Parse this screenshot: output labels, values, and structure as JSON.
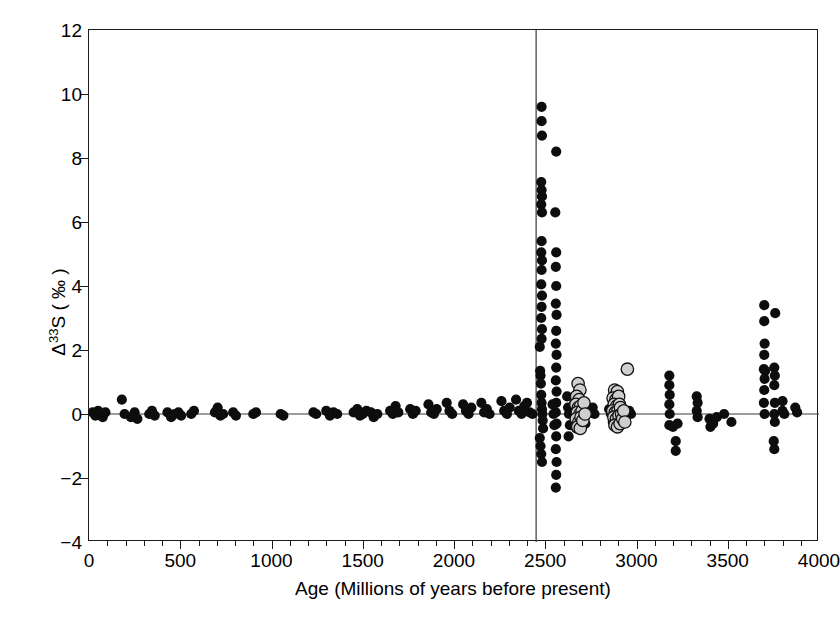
{
  "figure": {
    "x_axis": {
      "title": "Age (Millions of years before present)",
      "min": 0,
      "max": 4000,
      "major_ticks": [
        0,
        500,
        1000,
        1500,
        2000,
        2500,
        3000,
        3500,
        4000
      ],
      "tick_labels": [
        "0",
        "500",
        "1000",
        "1500",
        "2000",
        "2500",
        "3000",
        "3500",
        "4000"
      ],
      "minor_tick_step": 100
    },
    "y_axis": {
      "title_prefix": "Δ",
      "title_sup": "33",
      "title_suffix": "S ( ‰ )",
      "title_plain": "Δ33S ( ‰ )",
      "min": -4,
      "max": 12,
      "major_ticks": [
        -4,
        -2,
        0,
        2,
        4,
        6,
        8,
        10,
        12
      ],
      "tick_labels": [
        "−4",
        "−2",
        "0",
        "2",
        "4",
        "6",
        "8",
        "10",
        "12"
      ]
    },
    "reference_lines": {
      "vertical_age": 2450,
      "horizontal_value": 0,
      "color": "#3a3a3a"
    },
    "colors": {
      "black_marker": "#0d0d0d",
      "gray_marker_fill": "#cfcfcf",
      "gray_marker_stroke": "#111111",
      "axis": "#1a1a1a",
      "background": "#ffffff"
    }
  },
  "chart_data": {
    "type": "scatter",
    "title": "",
    "xlabel": "Age (Millions of years before present)",
    "ylabel": "Δ33S ( ‰ )",
    "xlim": [
      0,
      4000
    ],
    "ylim": [
      -4,
      12
    ],
    "grid": false,
    "legend": "none",
    "annotations": [
      {
        "type": "vline",
        "x": 2450,
        "note": "Great Oxidation Event boundary"
      },
      {
        "type": "hline",
        "y": 0,
        "note": "zero mass-independent fractionation"
      }
    ],
    "series": [
      {
        "name": "black-circles",
        "marker": "filled-circle-black",
        "points": [
          [
            20,
            0.05
          ],
          [
            35,
            -0.05
          ],
          [
            50,
            0.1
          ],
          [
            60,
            0.0
          ],
          [
            75,
            -0.1
          ],
          [
            90,
            0.05
          ],
          [
            180,
            0.45
          ],
          [
            195,
            0.0
          ],
          [
            230,
            -0.1
          ],
          [
            250,
            0.05
          ],
          [
            265,
            -0.15
          ],
          [
            330,
            0.0
          ],
          [
            345,
            0.1
          ],
          [
            360,
            -0.05
          ],
          [
            430,
            0.05
          ],
          [
            450,
            -0.1
          ],
          [
            470,
            0.0
          ],
          [
            490,
            0.05
          ],
          [
            505,
            -0.05
          ],
          [
            560,
            0.0
          ],
          [
            575,
            0.1
          ],
          [
            690,
            0.05
          ],
          [
            705,
            0.2
          ],
          [
            720,
            -0.05
          ],
          [
            735,
            0.0
          ],
          [
            790,
            0.05
          ],
          [
            805,
            -0.05
          ],
          [
            900,
            0.0
          ],
          [
            915,
            0.05
          ],
          [
            1050,
            0.0
          ],
          [
            1065,
            -0.05
          ],
          [
            1230,
            0.05
          ],
          [
            1245,
            0.0
          ],
          [
            1300,
            0.1
          ],
          [
            1320,
            -0.05
          ],
          [
            1340,
            0.05
          ],
          [
            1360,
            0.0
          ],
          [
            1450,
            0.05
          ],
          [
            1470,
            0.15
          ],
          [
            1485,
            -0.05
          ],
          [
            1500,
            0.0
          ],
          [
            1520,
            0.1
          ],
          [
            1545,
            0.05
          ],
          [
            1560,
            -0.1
          ],
          [
            1580,
            0.0
          ],
          [
            1650,
            0.1
          ],
          [
            1665,
            0.0
          ],
          [
            1680,
            0.25
          ],
          [
            1695,
            0.05
          ],
          [
            1760,
            0.15
          ],
          [
            1775,
            0.0
          ],
          [
            1790,
            0.1
          ],
          [
            1860,
            0.3
          ],
          [
            1875,
            0.05
          ],
          [
            1890,
            0.0
          ],
          [
            1905,
            0.15
          ],
          [
            1960,
            0.35
          ],
          [
            1975,
            0.1
          ],
          [
            1990,
            0.0
          ],
          [
            2050,
            0.3
          ],
          [
            2065,
            0.1
          ],
          [
            2080,
            0.0
          ],
          [
            2095,
            0.2
          ],
          [
            2150,
            0.35
          ],
          [
            2165,
            0.05
          ],
          [
            2180,
            0.15
          ],
          [
            2195,
            0.0
          ],
          [
            2260,
            0.4
          ],
          [
            2275,
            0.1
          ],
          [
            2290,
            0.0
          ],
          [
            2305,
            0.2
          ],
          [
            2340,
            0.45
          ],
          [
            2355,
            0.1
          ],
          [
            2370,
            0.0
          ],
          [
            2385,
            0.25
          ],
          [
            2400,
            0.35
          ],
          [
            2415,
            0.05
          ],
          [
            2430,
            0.0
          ],
          [
            2470,
            2.1
          ],
          [
            2472,
            1.35
          ],
          [
            2474,
            1.2
          ],
          [
            2476,
            0.95
          ],
          [
            2478,
            0.6
          ],
          [
            2480,
            0.35
          ],
          [
            2482,
            0.15
          ],
          [
            2484,
            0.0
          ],
          [
            2486,
            -0.2
          ],
          [
            2488,
            -0.45
          ],
          [
            2470,
            -0.75
          ],
          [
            2474,
            -1.0
          ],
          [
            2478,
            -1.25
          ],
          [
            2482,
            -1.5
          ],
          [
            2480,
            9.6
          ],
          [
            2480,
            9.15
          ],
          [
            2482,
            8.7
          ],
          [
            2478,
            7.25
          ],
          [
            2480,
            7.0
          ],
          [
            2482,
            6.8
          ],
          [
            2478,
            6.55
          ],
          [
            2482,
            6.3
          ],
          [
            2480,
            5.4
          ],
          [
            2478,
            5.05
          ],
          [
            2482,
            4.8
          ],
          [
            2480,
            4.5
          ],
          [
            2478,
            4.05
          ],
          [
            2482,
            3.7
          ],
          [
            2480,
            3.35
          ],
          [
            2478,
            3.0
          ],
          [
            2482,
            2.65
          ],
          [
            2480,
            2.35
          ],
          [
            2560,
            8.2
          ],
          [
            2555,
            6.3
          ],
          [
            2560,
            5.05
          ],
          [
            2558,
            4.6
          ],
          [
            2560,
            4.0
          ],
          [
            2558,
            3.45
          ],
          [
            2562,
            3.1
          ],
          [
            2560,
            2.6
          ],
          [
            2558,
            2.2
          ],
          [
            2562,
            1.85
          ],
          [
            2560,
            1.45
          ],
          [
            2558,
            1.05
          ],
          [
            2562,
            0.7
          ],
          [
            2560,
            0.35
          ],
          [
            2558,
            0.05
          ],
          [
            2562,
            -0.3
          ],
          [
            2560,
            -0.7
          ],
          [
            2558,
            -1.1
          ],
          [
            2562,
            -1.5
          ],
          [
            2560,
            -1.9
          ],
          [
            2558,
            -2.3
          ],
          [
            2540,
            0.3
          ],
          [
            2545,
            0.0
          ],
          [
            2550,
            -0.35
          ],
          [
            2620,
            0.55
          ],
          [
            2625,
            0.2
          ],
          [
            2630,
            0.0
          ],
          [
            2635,
            -0.35
          ],
          [
            2628,
            -0.7
          ],
          [
            2660,
            0.35
          ],
          [
            2665,
            0.0
          ],
          [
            2670,
            -0.45
          ],
          [
            2700,
            0.25
          ],
          [
            2710,
            0.0
          ],
          [
            2720,
            -0.3
          ],
          [
            2760,
            0.2
          ],
          [
            2770,
            0.0
          ],
          [
            2850,
            0.15
          ],
          [
            2860,
            0.0
          ],
          [
            2870,
            -0.25
          ],
          [
            2960,
            0.1
          ],
          [
            2970,
            0.0
          ],
          [
            3180,
            1.2
          ],
          [
            3180,
            0.9
          ],
          [
            3182,
            0.6
          ],
          [
            3180,
            0.3
          ],
          [
            3182,
            0.0
          ],
          [
            3180,
            -0.35
          ],
          [
            3200,
            -0.4
          ],
          [
            3225,
            -0.3
          ],
          [
            3215,
            -0.85
          ],
          [
            3215,
            -1.15
          ],
          [
            3330,
            0.55
          ],
          [
            3335,
            0.35
          ],
          [
            3330,
            0.1
          ],
          [
            3335,
            -0.1
          ],
          [
            3400,
            -0.15
          ],
          [
            3405,
            -0.4
          ],
          [
            3420,
            -0.3
          ],
          [
            3440,
            -0.1
          ],
          [
            3480,
            0.0
          ],
          [
            3520,
            -0.25
          ],
          [
            3700,
            3.4
          ],
          [
            3700,
            2.9
          ],
          [
            3702,
            2.2
          ],
          [
            3700,
            1.85
          ],
          [
            3698,
            1.4
          ],
          [
            3705,
            1.35
          ],
          [
            3702,
            1.1
          ],
          [
            3700,
            0.75
          ],
          [
            3698,
            0.35
          ],
          [
            3702,
            0.0
          ],
          [
            3760,
            3.15
          ],
          [
            3755,
            1.45
          ],
          [
            3758,
            1.2
          ],
          [
            3755,
            0.9
          ],
          [
            3758,
            0.35
          ],
          [
            3755,
            0.0
          ],
          [
            3758,
            -0.25
          ],
          [
            3752,
            -0.85
          ],
          [
            3755,
            -1.1
          ],
          [
            3800,
            0.4
          ],
          [
            3800,
            0.1
          ],
          [
            3810,
            0.0
          ],
          [
            3870,
            0.2
          ],
          [
            3880,
            0.05
          ]
        ]
      },
      {
        "name": "gray-circles",
        "marker": "filled-circle-gray",
        "points": [
          [
            2680,
            0.95
          ],
          [
            2690,
            0.75
          ],
          [
            2672,
            0.55
          ],
          [
            2686,
            0.45
          ],
          [
            2668,
            0.3
          ],
          [
            2682,
            0.2
          ],
          [
            2694,
            0.25
          ],
          [
            2676,
            0.05
          ],
          [
            2690,
            0.0
          ],
          [
            2702,
            0.1
          ],
          [
            2670,
            -0.15
          ],
          [
            2684,
            -0.25
          ],
          [
            2696,
            -0.1
          ],
          [
            2678,
            -0.4
          ],
          [
            2692,
            -0.45
          ],
          [
            2706,
            -0.2
          ],
          [
            2712,
            0.35
          ],
          [
            2718,
            0.0
          ],
          [
            2880,
            0.75
          ],
          [
            2895,
            0.7
          ],
          [
            2872,
            0.5
          ],
          [
            2888,
            0.45
          ],
          [
            2902,
            0.55
          ],
          [
            2878,
            0.3
          ],
          [
            2892,
            0.25
          ],
          [
            2906,
            0.3
          ],
          [
            2870,
            0.1
          ],
          [
            2884,
            0.05
          ],
          [
            2898,
            0.1
          ],
          [
            2912,
            0.2
          ],
          [
            2876,
            -0.1
          ],
          [
            2890,
            -0.15
          ],
          [
            2904,
            -0.05
          ],
          [
            2918,
            0.0
          ],
          [
            2882,
            -0.35
          ],
          [
            2896,
            -0.4
          ],
          [
            2910,
            -0.3
          ],
          [
            2924,
            -0.15
          ],
          [
            2930,
            0.1
          ],
          [
            2936,
            -0.25
          ],
          [
            2950,
            1.4
          ]
        ]
      }
    ]
  }
}
